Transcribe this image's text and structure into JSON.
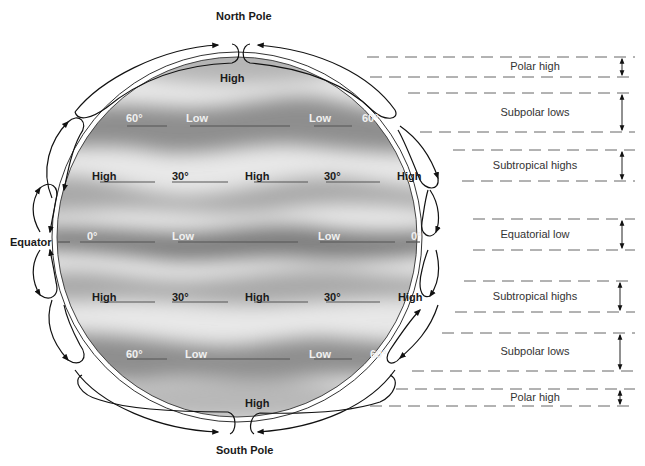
{
  "poles": {
    "north": "North Pole",
    "south": "South Pole"
  },
  "equator_label": "Equator",
  "globe": {
    "top_high": "High",
    "bottom_high": "High",
    "rows": [
      {
        "name": "north-60",
        "left": "60°",
        "mid1": "Low",
        "mid2": "Low",
        "right": "60°",
        "y": 118
      },
      {
        "name": "north-30",
        "left": "High",
        "mid1": "30°",
        "mid2": "High",
        "mid3": "30°",
        "right": "High",
        "y": 176
      },
      {
        "name": "equator-0",
        "left": "0°",
        "mid1": "Low",
        "mid2": "Low",
        "right": "0°",
        "y": 236
      },
      {
        "name": "south-30",
        "left": "High",
        "mid1": "30°",
        "mid2": "High",
        "mid3": "30°",
        "right": "High",
        "y": 297
      },
      {
        "name": "south-60",
        "left": "60°",
        "mid1": "Low",
        "mid2": "Low",
        "right": "60°",
        "y": 354
      }
    ]
  },
  "belts": [
    {
      "label": "Polar high",
      "top": 57,
      "bottom": 77
    },
    {
      "label": "Subpolar lows",
      "top": 93,
      "bottom": 132
    },
    {
      "label": "Subtropical highs",
      "top": 150,
      "bottom": 181
    },
    {
      "label": "Equatorial low",
      "top": 219,
      "bottom": 250
    },
    {
      "label": "Subtropical highs",
      "top": 281,
      "bottom": 312
    },
    {
      "label": "Subpolar lows",
      "top": 333,
      "bottom": 371
    },
    {
      "label": "Polar high",
      "top": 389,
      "bottom": 406
    }
  ],
  "colors": {
    "globe_light": "#ececec",
    "globe_dark": "#8a8a8a",
    "line": "#222222",
    "dash": "#666666"
  }
}
